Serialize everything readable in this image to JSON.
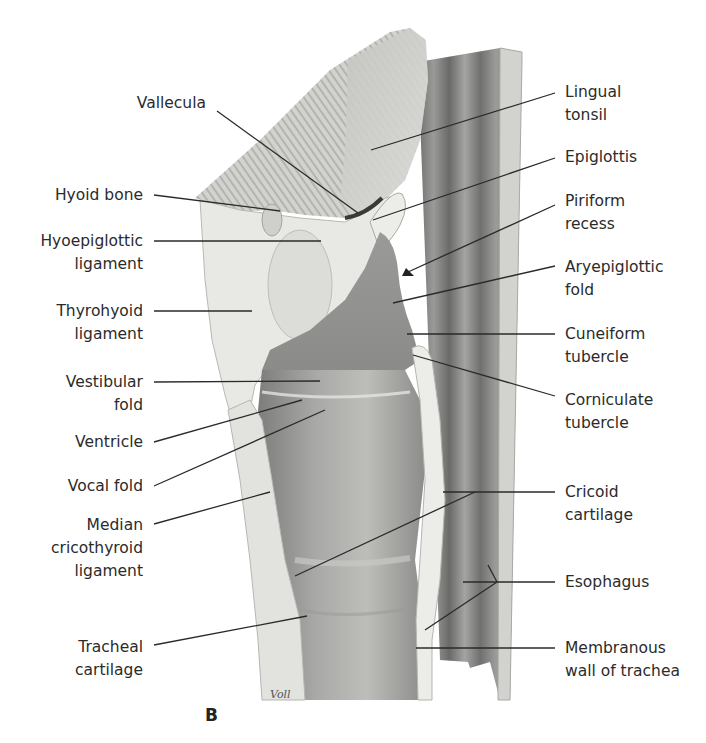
{
  "figure": {
    "panel_letter": "B",
    "artist_signature": "Voll",
    "colors": {
      "background": "#ffffff",
      "leader_line": "#2a2a2a",
      "tissue_light": "#e6e6e2",
      "tissue_mid": "#b9b9b6",
      "tissue_dark": "#7c7c7a",
      "esophagus": "#8e8e8c",
      "cartilage": "#f1f1ee"
    }
  },
  "labels_left": [
    {
      "id": "vallecula",
      "lines": [
        "Vallecula"
      ]
    },
    {
      "id": "hyoid-bone",
      "lines": [
        "Hyoid bone"
      ]
    },
    {
      "id": "hyoepiglottic-ligament",
      "lines": [
        "Hyoepiglottic",
        "ligament"
      ]
    },
    {
      "id": "thyrohyoid-ligament",
      "lines": [
        "Thyrohyoid",
        "ligament"
      ]
    },
    {
      "id": "vestibular-fold",
      "lines": [
        "Vestibular",
        "fold"
      ]
    },
    {
      "id": "ventricle",
      "lines": [
        "Ventricle"
      ]
    },
    {
      "id": "vocal-fold",
      "lines": [
        "Vocal fold"
      ]
    },
    {
      "id": "median-cricothyroid-ligament",
      "lines": [
        "Median",
        "cricothyroid",
        "ligament"
      ]
    },
    {
      "id": "tracheal-cartilage",
      "lines": [
        "Tracheal",
        "cartilage"
      ]
    }
  ],
  "labels_right": [
    {
      "id": "lingual-tonsil",
      "lines": [
        "Lingual",
        "tonsil"
      ]
    },
    {
      "id": "epiglottis",
      "lines": [
        "Epiglottis"
      ]
    },
    {
      "id": "piriform-recess",
      "lines": [
        "Piriform",
        "recess"
      ]
    },
    {
      "id": "aryepiglottic-fold",
      "lines": [
        "Aryepiglottic",
        "fold"
      ]
    },
    {
      "id": "cuneiform-tubercle",
      "lines": [
        "Cuneiform",
        "tubercle"
      ]
    },
    {
      "id": "corniculate-tubercle",
      "lines": [
        "Corniculate",
        "tubercle"
      ]
    },
    {
      "id": "cricoid-cartilage",
      "lines": [
        "Cricoid",
        "cartilage"
      ]
    },
    {
      "id": "esophagus",
      "lines": [
        "Esophagus"
      ]
    },
    {
      "id": "membranous-wall-of-trachea",
      "lines": [
        "Membranous",
        "wall of trachea"
      ]
    }
  ]
}
